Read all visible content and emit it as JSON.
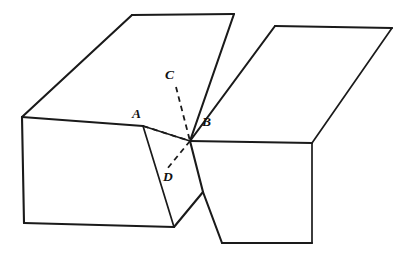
{
  "figure": {
    "background_color": "#ffffff",
    "line_color": "#1a1a1a",
    "canvas": {
      "width": 416,
      "height": 260
    },
    "labels": [
      {
        "id": "label-A",
        "text": "A",
        "x": 132,
        "y": 107
      },
      {
        "id": "label-B",
        "text": "B",
        "x": 202,
        "y": 115
      },
      {
        "id": "label-C",
        "text": "C",
        "x": 165,
        "y": 68
      },
      {
        "id": "label-D",
        "text": "D",
        "x": 163,
        "y": 170
      }
    ],
    "points": {
      "A": {
        "x": 143,
        "y": 126
      },
      "B": {
        "x": 190,
        "y": 141
      },
      "C": {
        "x": 176,
        "y": 87
      },
      "D": {
        "x": 167,
        "y": 169
      }
    },
    "left_block": {
      "name": "left-block",
      "top_face": "22,117 132,15 234,14 143,126",
      "front_face": "22,117 143,126 174,227 24,223",
      "cut_face": "143,126 190,141 203,192 174,227",
      "top_face_edges": [
        "22,117 132,15",
        "132,15 234,14",
        "22,117 143,126"
      ],
      "front_face_edges": [
        "22,117 24,223",
        "24,223 174,227",
        "143,126 174,227"
      ],
      "cut_face_edges": [
        "143,126 190,141",
        "190,141 203,192",
        "203,192 174,227"
      ],
      "back_right_edge": "234,14 190,141"
    },
    "right_block": {
      "name": "right-block",
      "top_face": "190,141 275,26 392,28 312,143",
      "front_face": "190,141 312,143 312,243 222,243",
      "top_face_edges": [
        "190,141 275,26",
        "275,26 392,28",
        "392,28 312,143"
      ],
      "front_face_edges": [
        "190,141 312,143",
        "312,143 312,243",
        "312,243 222,243",
        "222,243 203,192"
      ]
    },
    "dashed_segments": [
      {
        "id": "segment-AB",
        "from": "A",
        "to": "B",
        "path": "143,126 190,141"
      },
      {
        "id": "segment-CB",
        "from": "C",
        "to": "B",
        "path": "176,87 190,141"
      },
      {
        "id": "segment-BD",
        "from": "B",
        "to": "D",
        "path": "190,141 167,169"
      }
    ]
  }
}
